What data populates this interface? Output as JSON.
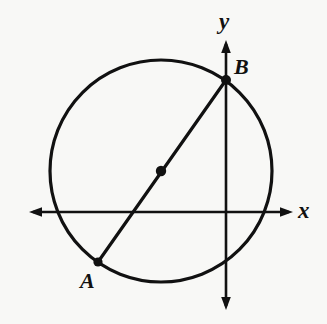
{
  "figure": {
    "background_color": "#f8f8f6",
    "ink_color": "#111111"
  },
  "axes": {
    "x_axis": {
      "label": "x",
      "y_position": 212,
      "x_start": 29,
      "x_end": 293,
      "double_arrow": true
    },
    "y_axis": {
      "label": "y",
      "x_position": 226,
      "y_start": 40,
      "y_end": 310,
      "double_arrow": true
    }
  },
  "circle": {
    "center_x": 161,
    "center_y": 171,
    "radius": 111,
    "stroke_width": 3
  },
  "points": [
    {
      "label": "A",
      "x": 98,
      "y": 262,
      "dot": true,
      "label_x": 80,
      "label_y": 270
    },
    {
      "label": "B",
      "x": 226,
      "y": 80,
      "dot": true,
      "label_x": 234,
      "label_y": 56
    },
    {
      "label": "",
      "x": 161,
      "y": 171,
      "dot": true,
      "label_x": 0,
      "label_y": 0
    }
  ],
  "chord": {
    "name": "diameter-AB",
    "from": "A",
    "to": "B",
    "x1": 98,
    "y1": 262,
    "x2": 226,
    "y2": 80,
    "stroke_width": 3,
    "passes_through_center": true
  },
  "labels": {
    "x_axis": "x",
    "y_axis": "y",
    "point_a": "A",
    "point_b": "B"
  }
}
